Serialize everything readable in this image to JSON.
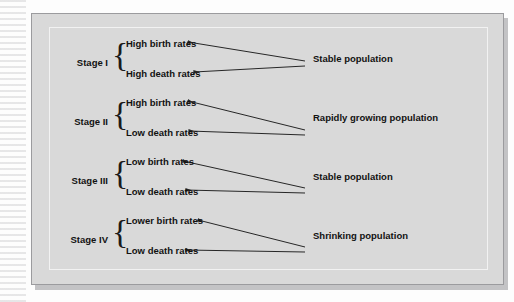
{
  "figure": {
    "colors": {
      "plate_background": "#d9d9d9",
      "plate_border": "#9b9b9e",
      "text": "#121212",
      "arrow": "#262626",
      "page_background": "#fdfdfd"
    }
  },
  "stages": [
    {
      "id": "stage-1",
      "label": "Stage I",
      "factors": [
        "High birth rates",
        "High death rates"
      ],
      "outcome": "Stable population"
    },
    {
      "id": "stage-2",
      "label": "Stage II",
      "factors": [
        "High birth rates",
        "Low death rates"
      ],
      "outcome": "Rapidly growing population"
    },
    {
      "id": "stage-3",
      "label": "Stage III",
      "factors": [
        "Low birth rates",
        "Low death rates"
      ],
      "outcome": "Stable population"
    },
    {
      "id": "stage-4",
      "label": "Stage IV",
      "factors": [
        "Lower birth rates",
        "Low death rates"
      ],
      "outcome": "Shrinking population"
    }
  ],
  "brace_glyph": "{"
}
